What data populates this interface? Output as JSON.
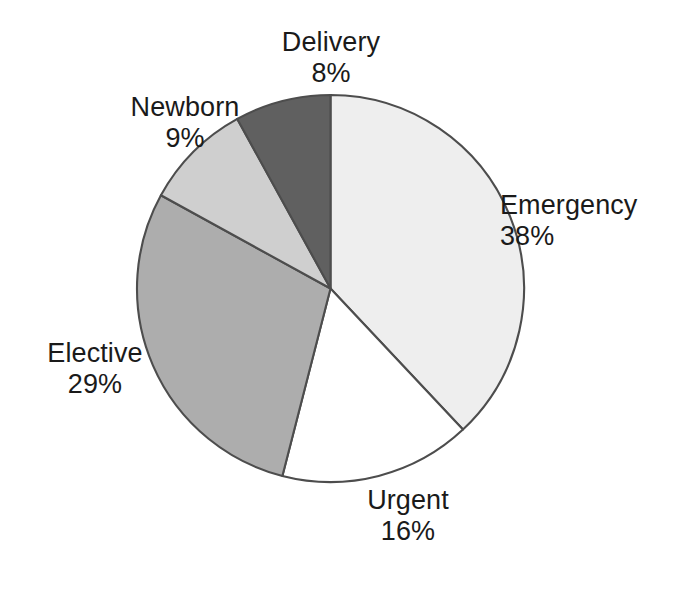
{
  "chart_data": {
    "type": "pie",
    "title": "",
    "subtitle": "",
    "xlabel": "",
    "ylabel": "",
    "legend": "none",
    "grid": false,
    "labels_position": "outside",
    "start_angle_deg": 0,
    "direction": "clockwise",
    "categories": [
      "Emergency",
      "Urgent",
      "Elective",
      "Newborn",
      "Delivery"
    ],
    "values": [
      38,
      16,
      29,
      9,
      8
    ],
    "value_suffix": "%",
    "units": "percent",
    "total": 100,
    "slice_colors": [
      "#eeeeee",
      "#ffffff",
      "#adadad",
      "#cfcfcf",
      "#606060"
    ],
    "slice_border_color": "#4d4d4d",
    "slices": [
      {
        "label": "Emergency",
        "value": 38,
        "value_text": "38%",
        "color": "#eeeeee",
        "start_deg": 0.0,
        "end_deg": 136.8
      },
      {
        "label": "Urgent",
        "value": 16,
        "value_text": "16%",
        "color": "#ffffff",
        "start_deg": 136.8,
        "end_deg": 194.4
      },
      {
        "label": "Elective",
        "value": 29,
        "value_text": "29%",
        "color": "#adadad",
        "start_deg": 194.4,
        "end_deg": 298.8
      },
      {
        "label": "Newborn",
        "value": 9,
        "value_text": "9%",
        "color": "#cfcfcf",
        "start_deg": 298.8,
        "end_deg": 331.2
      },
      {
        "label": "Delivery",
        "value": 8,
        "value_text": "8%",
        "color": "#606060",
        "start_deg": 331.2,
        "end_deg": 360.0
      }
    ]
  },
  "labels": {
    "emergency": {
      "name": "Emergency",
      "value": "38%"
    },
    "urgent": {
      "name": "Urgent",
      "value": "16%"
    },
    "elective": {
      "name": "Elective",
      "value": "29%"
    },
    "newborn": {
      "name": "Newborn",
      "value": "9%"
    },
    "delivery": {
      "name": "Delivery",
      "value": "8%"
    }
  }
}
